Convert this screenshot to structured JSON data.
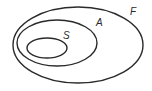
{
  "diagram": {
    "type": "nested-euler",
    "sets": [
      {
        "id": "F",
        "label": "F",
        "cx": 78,
        "cy": 45,
        "rx": 65,
        "ry": 38,
        "label_x": 130,
        "label_y": 15
      },
      {
        "id": "A",
        "label": "A",
        "cx": 57,
        "cy": 43,
        "rx": 40,
        "ry": 23,
        "label_x": 96,
        "label_y": 26
      },
      {
        "id": "S",
        "label": "S",
        "cx": 47,
        "cy": 48,
        "rx": 20,
        "ry": 10,
        "label_x": 63,
        "label_y": 39
      }
    ],
    "relation": "S ⊂ A ⊂ F",
    "stroke_color": "#2a2a2a",
    "background": "#ffffff"
  }
}
